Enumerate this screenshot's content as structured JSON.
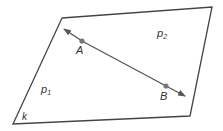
{
  "diagram": {
    "plane_label": "k",
    "regions": [
      {
        "label": "p",
        "subscript": "1"
      },
      {
        "label": "p",
        "subscript": "2"
      }
    ],
    "points": [
      {
        "label": "A"
      },
      {
        "label": "B"
      }
    ],
    "colors": {
      "outline": "#444444",
      "line": "#555555",
      "point": "#777777",
      "text": "#333333"
    }
  }
}
